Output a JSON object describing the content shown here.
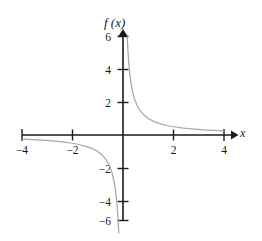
{
  "figure": {
    "background_color": "#ffffff",
    "axis_color": "#1a1a1a",
    "curve_color": "#a8a8a8",
    "function_label": "f (x)",
    "x_axis_name": "x"
  },
  "chart_data": {
    "type": "line",
    "title": "",
    "subtitle": "",
    "xlabel": "x",
    "ylabel": "f (x)",
    "xlim": [
      -4.4,
      4.4
    ],
    "ylim": [
      -6.4,
      6.4
    ],
    "grid": false,
    "legend": "none",
    "x_ticks": [
      -4,
      -2,
      2,
      4
    ],
    "x_tick_labels": [
      "−4",
      "−2",
      "2",
      "4"
    ],
    "y_ticks": [
      6,
      4,
      2,
      -2,
      -4,
      -6
    ],
    "y_tick_labels": [
      "6",
      "4",
      "2",
      "−2",
      "−4",
      "−6"
    ],
    "function": "f(x) = 1/x",
    "asymptotes": {
      "vertical": 0,
      "horizontal": 0
    },
    "annotations": [],
    "series": [
      {
        "name": "branch-right",
        "x": [
          0.168,
          0.18,
          0.2,
          0.22,
          0.25,
          0.285,
          0.33,
          0.38,
          0.45,
          0.55,
          0.68,
          0.85,
          1.0,
          1.25,
          1.5,
          1.8,
          2.0,
          2.4,
          2.8,
          3.2,
          3.6,
          4.0
        ],
        "y": [
          5.95,
          5.56,
          5.0,
          4.55,
          4.0,
          3.51,
          3.03,
          2.63,
          2.22,
          1.82,
          1.47,
          1.18,
          1.0,
          0.8,
          0.67,
          0.56,
          0.5,
          0.42,
          0.36,
          0.31,
          0.28,
          0.25
        ]
      },
      {
        "name": "branch-left",
        "x": [
          -4.0,
          -3.6,
          -3.2,
          -2.8,
          -2.4,
          -2.0,
          -1.8,
          -1.5,
          -1.25,
          -1.0,
          -0.85,
          -0.68,
          -0.55,
          -0.45,
          -0.38,
          -0.33,
          -0.285,
          -0.25,
          -0.22,
          -0.2,
          -0.18,
          -0.168
        ],
        "y": [
          -0.25,
          -0.28,
          -0.31,
          -0.36,
          -0.42,
          -0.5,
          -0.56,
          -0.67,
          -0.8,
          -1.0,
          -1.18,
          -1.47,
          -1.82,
          -2.22,
          -2.63,
          -3.03,
          -3.51,
          -4.0,
          -4.55,
          -5.0,
          -5.56,
          -5.95
        ]
      }
    ]
  }
}
